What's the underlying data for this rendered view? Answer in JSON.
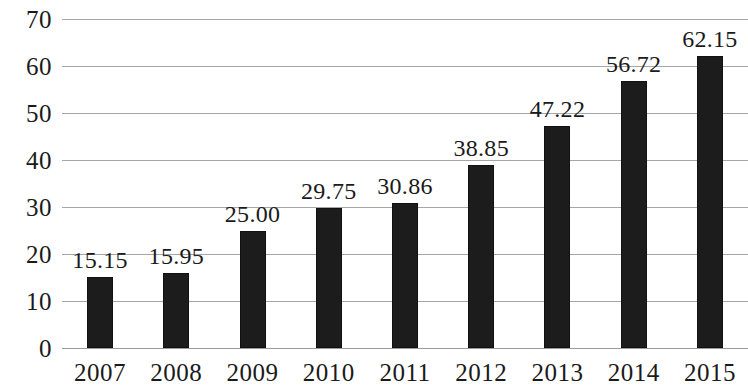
{
  "chart_data": {
    "type": "bar",
    "title": "",
    "subtitle": "",
    "xlabel": "",
    "ylabel": "",
    "categories": [
      "2007",
      "2008",
      "2009",
      "2010",
      "2011",
      "2012",
      "2013",
      "2014",
      "2015"
    ],
    "values": [
      15.15,
      15.95,
      25.0,
      29.75,
      30.86,
      38.85,
      47.22,
      56.72,
      62.15
    ],
    "data_labels": [
      "15.15",
      "15.95",
      "25.00",
      "29.75",
      "30.86",
      "38.85",
      "47.22",
      "56.72",
      "62.15"
    ],
    "ylim": [
      0,
      70
    ],
    "ytick_labels": [
      "70",
      "60",
      "50",
      "40",
      "30",
      "20",
      "10",
      "0"
    ],
    "ytick_values": [
      70,
      60,
      50,
      40,
      30,
      20,
      10,
      0
    ],
    "grid": true,
    "legend": false,
    "legend_position": "none",
    "series": [
      {
        "name": "",
        "values": [
          15.15,
          15.95,
          25.0,
          29.75,
          30.86,
          38.85,
          47.22,
          56.72,
          62.15
        ]
      }
    ],
    "colors": {
      "bar_fill": "#1c1c1c",
      "gridline": "#a6a6a6",
      "text": "#1a1a1a",
      "background": "#ffffff"
    }
  }
}
